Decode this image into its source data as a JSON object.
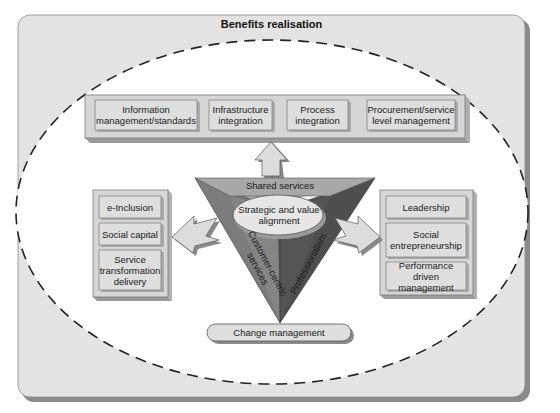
{
  "diagram": {
    "title": "Benefits realisation",
    "top_group": {
      "items": [
        {
          "label_line1": "Information",
          "label_line2": "management/standards"
        },
        {
          "label_line1": "Infrastructure",
          "label_line2": "integration"
        },
        {
          "label_line1": "Process",
          "label_line2": "integration"
        },
        {
          "label_line1": "Procurement/service",
          "label_line2": "level management"
        }
      ]
    },
    "left_group": {
      "items": [
        {
          "label_line1": "e-Inclusion"
        },
        {
          "label_line1": "Social capital"
        },
        {
          "label_line1": "Service",
          "label_line2": "transformation",
          "label_line3": "delivery"
        }
      ]
    },
    "right_group": {
      "items": [
        {
          "label_line1": "Leadership"
        },
        {
          "label_line1": "Social",
          "label_line2": "entrepreneurship"
        },
        {
          "label_line1": "Performance driven",
          "label_line2": "management"
        }
      ]
    },
    "pyramid": {
      "top_face_label": "Shared services",
      "left_face_label_line1": "Customer-centric",
      "left_face_label_line2": "services",
      "right_face_label": "Professionalism",
      "center_label_line1": "Strategic and value",
      "center_label_line2": "alignment"
    },
    "base_label": "Change management",
    "colors": {
      "panel": "#e3e3e3",
      "panel_shadow": "#8a8a8a",
      "inner_white": "#ffffff",
      "box_face": "#d9d9d9",
      "box_edge": "#9a9a9a",
      "pyramid_top": "#a8a8a8",
      "pyramid_left": "#7c7c7c",
      "pyramid_right": "#4e4e4e",
      "arrow_fill": "#dcdcdc"
    }
  }
}
